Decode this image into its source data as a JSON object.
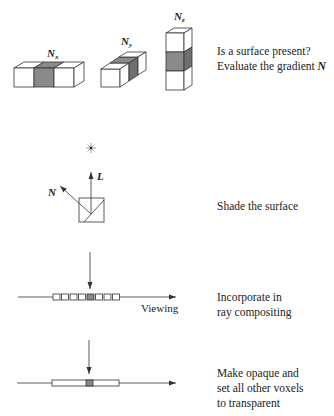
{
  "steps": [
    {
      "id": "gradient",
      "lines": [
        "Is a surface present?",
        "Evaluate the gradient "
      ],
      "emphasis": "N",
      "figure_labels": {
        "nx": "N",
        "nx_sub": "x",
        "ny": "N",
        "ny_sub": "y",
        "nz": "N",
        "nz_sub": "z"
      }
    },
    {
      "id": "shade",
      "lines": [
        "Shade the surface"
      ],
      "figure_labels": {
        "normal": "N",
        "light": "L"
      }
    },
    {
      "id": "composite",
      "lines": [
        "Incorporate in",
        "ray compositing"
      ],
      "figure_labels": {
        "ray": "Viewing"
      },
      "voxel_count": 8,
      "highlighted_voxel_index": 4
    },
    {
      "id": "opaque",
      "lines": [
        "Make opaque and",
        "set all other voxels",
        "to transparent"
      ],
      "highlighted_position": 0.5
    }
  ],
  "colors": {
    "stroke": "#333333",
    "shaded": "#8a8a8a",
    "shaded_side": "#6f6f6f",
    "background": "#ffffff"
  }
}
